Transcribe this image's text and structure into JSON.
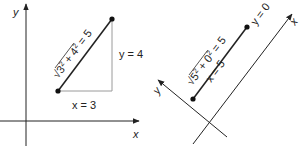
{
  "colors": {
    "axis": "#222222",
    "segment": "#222222",
    "leg": "#9a9a9a",
    "point": "#111111",
    "text": "#222222"
  },
  "left_diagram": {
    "axis_x_label": "x",
    "axis_y_label": "y",
    "point_a": {
      "x": 58,
      "y": 91
    },
    "point_b": {
      "x": 112,
      "y": 19
    },
    "leg_x_label": "x = 3",
    "leg_y_label": "y = 4",
    "hypotenuse_label": {
      "radical": "√",
      "base1": "3",
      "exp1": "2",
      "plus": " + ",
      "base2": "4",
      "exp2": "2",
      "result": " = 5"
    }
  },
  "right_diagram": {
    "axis_x_label": "x",
    "axis_y_label": "y",
    "point_c": {
      "x": 193,
      "y": 99
    },
    "point_d": {
      "x": 247,
      "y": 27
    },
    "leg_x_label": "x = 5",
    "leg_y_label": "y = 0",
    "segment_label": {
      "radical": "√",
      "base1": "5",
      "exp1": "2",
      "plus": " + ",
      "base2": "0",
      "exp2": "2",
      "result": " = 5"
    }
  }
}
